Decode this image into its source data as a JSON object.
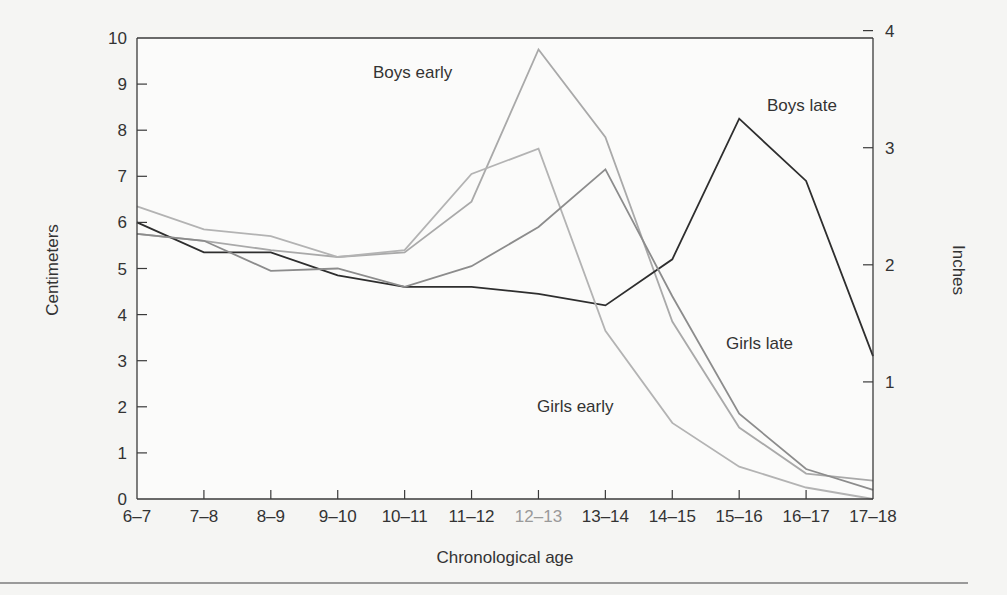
{
  "chart_data": {
    "type": "line",
    "title": "",
    "xlabel": "Chronological age",
    "ylabel": "Centimeters",
    "y2label": "Inches",
    "categories": [
      "6–7",
      "7–8",
      "8–9",
      "9–10",
      "10–11",
      "11–12",
      "12–13",
      "13–14",
      "14–15",
      "15–16",
      "16–17",
      "17–18"
    ],
    "ylim": [
      0,
      10
    ],
    "yticks": [
      0,
      1,
      2,
      3,
      4,
      5,
      6,
      7,
      8,
      9,
      10
    ],
    "y2ticks": [
      1,
      2,
      3,
      4
    ],
    "y2_unit_per_y": 0.3937,
    "grid": false,
    "legend": "inline labels",
    "series": [
      {
        "name": "Boys early",
        "color": "#a9a9a9",
        "values": [
          5.75,
          5.6,
          5.4,
          5.25,
          5.35,
          6.45,
          9.75,
          7.85,
          3.85,
          1.55,
          0.55,
          0.4
        ]
      },
      {
        "name": "Boys late",
        "color": "#2e2e2e",
        "values": [
          6.0,
          5.35,
          5.35,
          4.85,
          4.6,
          4.6,
          4.45,
          4.2,
          5.2,
          8.25,
          6.9,
          3.1
        ]
      },
      {
        "name": "Girls early",
        "color": "#b3b3b3",
        "values": [
          6.35,
          5.85,
          5.7,
          5.25,
          5.4,
          7.05,
          7.6,
          3.65,
          1.65,
          0.7,
          0.25,
          0.0
        ]
      },
      {
        "name": "Girls late",
        "color": "#8c8c8c",
        "values": [
          5.75,
          5.6,
          4.95,
          5.0,
          4.6,
          5.05,
          5.9,
          7.15,
          4.4,
          1.85,
          0.65,
          0.2
        ]
      }
    ],
    "annotations": [
      {
        "text": "Boys early",
        "x": 373,
        "y": 78
      },
      {
        "text": "Boys late",
        "x": 767,
        "y": 111
      },
      {
        "text": "Girls late",
        "x": 726,
        "y": 349
      },
      {
        "text": "Girls early",
        "x": 537,
        "y": 412
      }
    ]
  },
  "layout": {
    "plot": {
      "left": 137,
      "right": 873,
      "top": 38,
      "bottom": 499
    },
    "tick_label_color": "#333333",
    "highlight_tick_index": 6,
    "highlight_tick_color": "#9a9a9a"
  }
}
